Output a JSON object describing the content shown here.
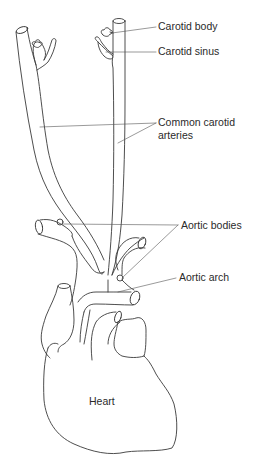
{
  "diagram": {
    "labels": {
      "carotid_body": "Carotid body",
      "carotid_sinus": "Carotid sinus",
      "common_carotid_line1": "Common carotid",
      "common_carotid_line2": "arteries",
      "aortic_bodies": "Aortic bodies",
      "aortic_arch": "Aortic arch",
      "heart": "Heart"
    },
    "colors": {
      "stroke": "#3a3a3a",
      "leader": "#555555",
      "text": "#2a2a2a",
      "background": "#ffffff"
    }
  }
}
